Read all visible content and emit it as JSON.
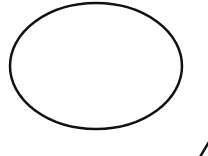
{
  "canvas": {
    "width": 208,
    "height": 156,
    "background": "#ffffff"
  },
  "shapes": {
    "ellipse": {
      "cx": 96,
      "cy": 66,
      "rx": 86,
      "ry": 63,
      "stroke": "#111111",
      "stroke_width": 2.5,
      "fill": "none"
    },
    "line": {
      "x1": 200,
      "y1": 157,
      "x2": 209,
      "y2": 142,
      "stroke": "#111111",
      "stroke_width": 2.5
    }
  }
}
